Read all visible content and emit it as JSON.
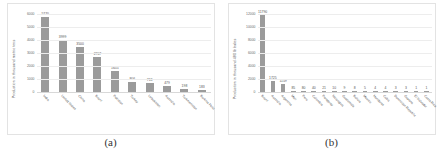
{
  "figure": {
    "panels": [
      {
        "caption": "(a)",
        "chart_data": {
          "type": "bar",
          "title": "",
          "xlabel": "",
          "ylabel": "Production in thousand metric tons",
          "ylim": [
            0,
            6000
          ],
          "yticks": [
            0,
            1000,
            2000,
            3000,
            4000,
            5000,
            6000
          ],
          "ytick_labels": [
            "0",
            "1000",
            "2000",
            "3000",
            "4000",
            "5000",
            "6000"
          ],
          "grid": true,
          "legend": "none",
          "categories": [
            "India",
            "United States",
            "China",
            "Brazil",
            "Pakistan",
            "Turkey",
            "Uzbekistan",
            "Australia",
            "Turkmenistan",
            "Burkina Faso"
          ],
          "values": [
            5770,
            3999,
            3500,
            2707,
            1655,
            806,
            713,
            479,
            198,
            183
          ],
          "value_labels": [
            "5770",
            "3999",
            "3500",
            "2707",
            "1655",
            "806",
            "713",
            "479",
            "198",
            "183"
          ]
        }
      },
      {
        "caption": "(b)",
        "chart_data": {
          "type": "bar",
          "title": "",
          "xlabel": "",
          "ylabel": "Production in thousand 480 lb bales",
          "ylim": [
            0,
            12000
          ],
          "yticks": [
            0,
            2000,
            4000,
            6000,
            8000,
            10000,
            12000
          ],
          "ytick_labels": [
            "0",
            "2000",
            "4000",
            "6000",
            "8000",
            "10000",
            "12000"
          ],
          "grid": true,
          "legend": "none",
          "categories": [
            "Brazil",
            "Australia",
            "Argentina",
            "Mali",
            "Peru",
            "Colombia",
            "Paraguay",
            "Nicaragua",
            "Guatemala",
            "Bolivia",
            "Mexico",
            "Honduras",
            "Cuba",
            "Dominican Republic",
            "Guyana",
            "El Salvador",
            "Costa Rica"
          ],
          "values": [
            11790,
            1725,
            1159,
            85,
            80,
            40,
            21,
            10,
            9,
            8,
            5,
            4,
            4,
            3,
            3,
            1,
            1
          ],
          "value_labels": [
            "11790",
            "1725",
            "1159",
            "85",
            "80",
            "40",
            "21",
            "10",
            "9",
            "8",
            "5",
            "4",
            "4",
            "3",
            "3",
            "1",
            "1"
          ]
        }
      }
    ]
  },
  "colors": {
    "bar": "#9b9b9b",
    "grid": "#ededed",
    "text": "#555555",
    "panel_border": "#e3e3e3",
    "background": "#ffffff"
  }
}
